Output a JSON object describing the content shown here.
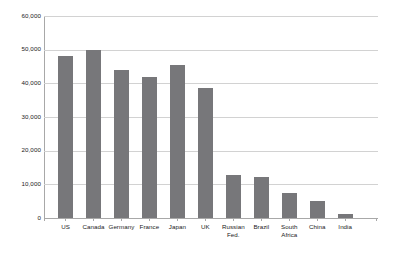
{
  "chart_data": {
    "type": "bar",
    "title": "",
    "subtitle": "",
    "xlabel": "",
    "ylabel": "",
    "categories": [
      "US",
      "Canada",
      "Germany",
      "France",
      "Japan",
      "UK",
      "Russian Fed.",
      "Brazil",
      "South Africa",
      "China",
      "India"
    ],
    "category_lines": [
      [
        "US"
      ],
      [
        "Canada"
      ],
      [
        "Germany"
      ],
      [
        "France"
      ],
      [
        "Japan"
      ],
      [
        "UK"
      ],
      [
        "Russian",
        "Fed."
      ],
      [
        "Brazil"
      ],
      [
        "South",
        "Africa"
      ],
      [
        "China"
      ],
      [
        "India"
      ]
    ],
    "values": [
      48000,
      50000,
      44000,
      42000,
      45500,
      38500,
      12700,
      12300,
      7500,
      5000,
      1100
    ],
    "ylim": [
      0,
      60000
    ],
    "yticks": [
      0,
      10000,
      20000,
      30000,
      40000,
      50000,
      60000
    ],
    "ytick_labels": [
      "0",
      "10,000",
      "20,000",
      "30,000",
      "40,000",
      "50,000",
      "60,000"
    ],
    "grid": true,
    "grid_axis": "y",
    "legend": false,
    "legend_position": "none",
    "series": [
      {
        "name": "",
        "values": [
          48000,
          50000,
          44000,
          42000,
          45500,
          38500,
          12700,
          12300,
          7500,
          5000,
          1100
        ]
      }
    ]
  },
  "style": {
    "bar_color": "#77777a",
    "gridline_color": "#d2d2d2",
    "axis_color": "#a8a8a8",
    "text_color": "#1a1a1a",
    "background": "#ffffff"
  }
}
